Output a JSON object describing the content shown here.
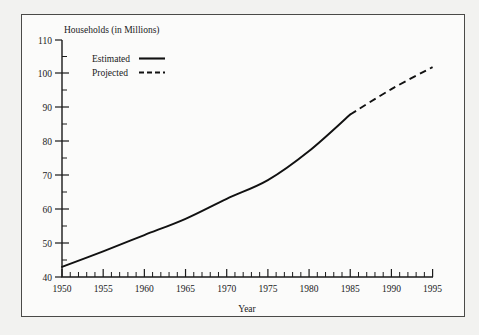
{
  "chart_data": {
    "type": "line",
    "title": "",
    "ylabel": "Households (in Millions)",
    "xlabel": "Year",
    "xlim": [
      1950,
      1995
    ],
    "ylim": [
      40,
      110
    ],
    "grid": false,
    "legend_position": "top-left-inside",
    "y_ticks_major": [
      40,
      50,
      60,
      70,
      80,
      90,
      100,
      110
    ],
    "y_ticks_minor": [
      45,
      55,
      65,
      75,
      85,
      95,
      105
    ],
    "x_ticks_major": [
      1950,
      1955,
      1960,
      1965,
      1970,
      1975,
      1980,
      1985,
      1990,
      1995
    ],
    "x_tick_minor_step": 1,
    "series": [
      {
        "name": "Estimated",
        "style": "solid",
        "x": [
          1950,
          1955,
          1960,
          1965,
          1970,
          1975,
          1980,
          1985
        ],
        "values": [
          43.0,
          47.6,
          52.4,
          57.2,
          63.1,
          68.6,
          77.2,
          88.0
        ]
      },
      {
        "name": "Projected",
        "style": "dashed",
        "x": [
          1985,
          1990,
          1995
        ],
        "values": [
          88.0,
          95.5,
          102.0
        ]
      }
    ],
    "legend": [
      {
        "label": "Estimated",
        "style": "solid"
      },
      {
        "label": "Projected",
        "style": "dashed"
      }
    ]
  },
  "axis": {
    "y_title": "Households (in Millions)",
    "x_title": "Year",
    "y_labels": [
      "110",
      "100",
      "90",
      "80",
      "70",
      "60",
      "50",
      "40"
    ],
    "x_labels": [
      "1950",
      "1955",
      "1960",
      "1965",
      "1970",
      "1975",
      "1980",
      "1985",
      "1990",
      "1995"
    ]
  },
  "legend": {
    "estimated_label": "Estimated",
    "projected_label": "Projected"
  },
  "colors": {
    "line": "#111111",
    "axis": "#1a1a1a",
    "page_background": "#f2f2f0",
    "panel_background": "#fbfbfa",
    "frame": "#4a4a48"
  }
}
